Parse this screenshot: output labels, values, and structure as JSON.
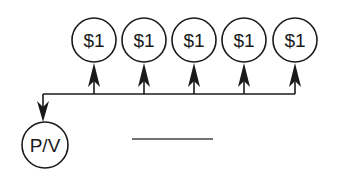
{
  "diagram": {
    "type": "cash-flow-timeline",
    "colors": {
      "stroke": "#1a1a1a",
      "background": "#ffffff"
    },
    "cash_flows": [
      {
        "label": "$1",
        "cx": 94,
        "cy": 40
      },
      {
        "label": "$1",
        "cx": 144,
        "cy": 40
      },
      {
        "label": "$1",
        "cx": 194,
        "cy": 40
      },
      {
        "label": "$1",
        "cx": 244,
        "cy": 40
      },
      {
        "label": "$1",
        "cx": 295,
        "cy": 40
      }
    ],
    "present_value": {
      "label": "P/V",
      "cx": 45,
      "cy": 145
    },
    "answer_blank": {
      "x1": 132,
      "x2": 213,
      "y": 139
    }
  }
}
